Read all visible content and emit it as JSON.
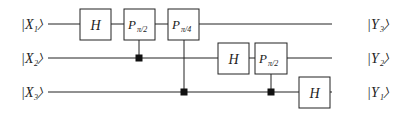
{
  "diagram": {
    "title": "",
    "inputs": [
      {
        "ket_open": "|",
        "name": "X",
        "sub": "1",
        "ket_close": "〉"
      },
      {
        "ket_open": "|",
        "name": "X",
        "sub": "2",
        "ket_close": "〉"
      },
      {
        "ket_open": "|",
        "name": "X",
        "sub": "3",
        "ket_close": "〉"
      }
    ],
    "outputs": [
      {
        "ket_open": "|",
        "name": "Y",
        "sub": "3",
        "ket_close": "〉"
      },
      {
        "ket_open": "|",
        "name": "Y",
        "sub": "2",
        "ket_close": "〉"
      },
      {
        "ket_open": "|",
        "name": "Y",
        "sub": "1",
        "ket_close": "〉"
      }
    ],
    "gates": [
      {
        "label": "H",
        "sub": "",
        "wire": 1
      },
      {
        "label": "P",
        "sub": "π/2",
        "wire": 1,
        "control_wire": 2
      },
      {
        "label": "P",
        "sub": "π/4",
        "wire": 1,
        "control_wire": 3
      },
      {
        "label": "H",
        "sub": "",
        "wire": 2
      },
      {
        "label": "P",
        "sub": "π/2",
        "wire": 2,
        "control_wire": 3
      },
      {
        "label": "H",
        "sub": "",
        "wire": 3
      }
    ],
    "colors": {
      "line": "#222222",
      "box_fill": "#ffffff",
      "control": "#111111"
    }
  }
}
